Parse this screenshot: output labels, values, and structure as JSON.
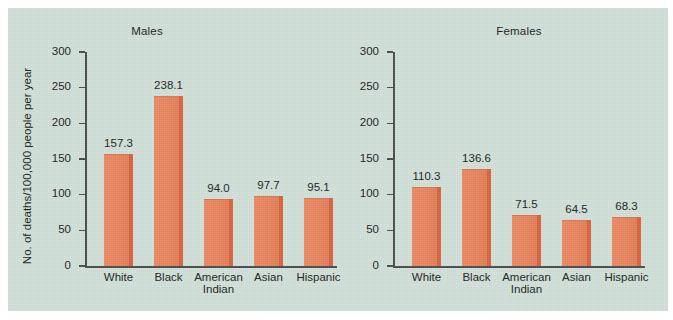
{
  "figure": {
    "background_color": "#cfdfd7",
    "bar_color": "#e9855f",
    "bar_shadow_color": "#d9603a",
    "axis_color": "#4a4a4a",
    "text_color": "#1b1b1b"
  },
  "chart_data": [
    {
      "type": "bar",
      "title": "Males",
      "xlabel": "",
      "ylabel": "No. of deaths/100,000 people per year",
      "categories": [
        "White",
        "Black",
        "American Indian",
        "Asian",
        "Hispanic"
      ],
      "category_lines": [
        [
          "White"
        ],
        [
          "Black"
        ],
        [
          "American",
          "Indian"
        ],
        [
          "Asian"
        ],
        [
          "Hispanic"
        ]
      ],
      "values": [
        157.3,
        238.1,
        94.0,
        97.7,
        95.1
      ],
      "value_labels": [
        "157.3",
        "238.1",
        "94.0",
        "97.7",
        "95.1"
      ],
      "ylim": [
        0,
        300
      ],
      "yticks": [
        0,
        50,
        100,
        150,
        200,
        250,
        300
      ],
      "ytick_labels": [
        "0",
        "50",
        "100",
        "150",
        "200",
        "250",
        "300"
      ],
      "grid": false,
      "legend": "none"
    },
    {
      "type": "bar",
      "title": "Females",
      "xlabel": "",
      "ylabel": "",
      "categories": [
        "White",
        "Black",
        "American Indian",
        "Asian",
        "Hispanic"
      ],
      "category_lines": [
        [
          "White"
        ],
        [
          "Black"
        ],
        [
          "American",
          "Indian"
        ],
        [
          "Asian"
        ],
        [
          "Hispanic"
        ]
      ],
      "values": [
        110.3,
        136.6,
        71.5,
        64.5,
        68.3
      ],
      "value_labels": [
        "110.3",
        "136.6",
        "71.5",
        "64.5",
        "68.3"
      ],
      "ylim": [
        0,
        300
      ],
      "yticks": [
        0,
        50,
        100,
        150,
        200,
        250,
        300
      ],
      "ytick_labels": [
        "0",
        "50",
        "100",
        "150",
        "200",
        "250",
        "300"
      ],
      "grid": false,
      "legend": "none"
    }
  ]
}
